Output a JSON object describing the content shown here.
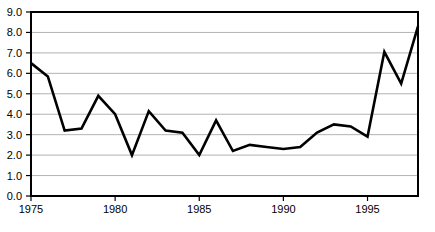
{
  "chart_data": {
    "type": "line",
    "title": "",
    "subtitle": "",
    "xlabel": "",
    "ylabel": "",
    "x": [
      1975,
      1976,
      1977,
      1978,
      1979,
      1980,
      1981,
      1982,
      1983,
      1984,
      1985,
      1986,
      1987,
      1988,
      1989,
      1990,
      1991,
      1992,
      1993,
      1994,
      1995,
      1996,
      1997,
      1998
    ],
    "values": [
      6.5,
      5.85,
      3.2,
      3.3,
      4.9,
      4.0,
      2.0,
      4.15,
      3.2,
      3.1,
      2.0,
      3.7,
      2.2,
      2.5,
      2.4,
      2.3,
      2.4,
      3.1,
      3.5,
      3.4,
      2.9,
      7.05,
      5.5,
      8.3
    ],
    "series": [
      {
        "name": "series-1",
        "values": [
          6.5,
          5.85,
          3.2,
          3.3,
          4.9,
          4.0,
          2.0,
          4.15,
          3.2,
          3.1,
          2.0,
          3.7,
          2.2,
          2.5,
          2.4,
          2.3,
          2.4,
          3.1,
          3.5,
          3.4,
          2.9,
          7.05,
          5.5,
          8.3
        ],
        "color": "#000000"
      }
    ],
    "xlim": [
      1975,
      1998
    ],
    "ylim": [
      0.0,
      9.0
    ],
    "x_ticks": [
      1975,
      1980,
      1985,
      1990,
      1995
    ],
    "x_tick_labels": [
      "1975",
      "1980",
      "1985",
      "1990",
      "1995"
    ],
    "y_ticks": [
      0.0,
      1.0,
      2.0,
      3.0,
      4.0,
      5.0,
      6.0,
      7.0,
      8.0,
      9.0
    ],
    "y_tick_labels": [
      "0.0",
      "1.0",
      "2.0",
      "3.0",
      "4.0",
      "5.0",
      "6.0",
      "7.0",
      "8.0",
      "9.0"
    ],
    "grid": {
      "horizontal": true,
      "vertical": false,
      "color": "#b3b3b3"
    },
    "legend": {
      "visible": false,
      "position": "none",
      "entries": []
    },
    "colors": {
      "line": "#000000",
      "axis": "#000000",
      "grid": "#b3b3b3",
      "background": "#ffffff",
      "text": "#000000"
    },
    "line_width": 2.6,
    "annotations": []
  }
}
